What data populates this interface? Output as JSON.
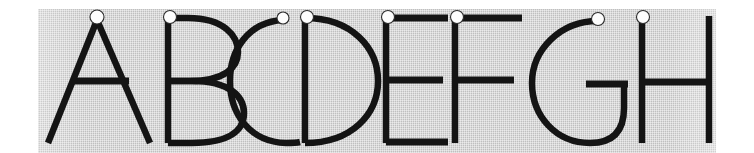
{
  "artwork": {
    "title": "Alphabet specimen A through H",
    "description": "Eight uppercase letterforms drawn in a light geometric sans-serif, printed in black on a gray halftone panel. A small white circle marks the starting point of the first stroke of each letter.",
    "letters": [
      "A",
      "B",
      "C",
      "D",
      "E",
      "F",
      "G",
      "H"
    ],
    "letter_count": 8,
    "stroke_color": "#141414",
    "panel_color": "#c9c9c9",
    "page_color": "#ffffff",
    "marker_fill": "#fdfdfd",
    "marker_stroke": "#2a2a2a",
    "marker_label": "stroke-start-marker",
    "panel": {
      "x": 38,
      "y": 9,
      "width": 678,
      "height": 144
    },
    "cap_top_y": 16,
    "baseline_y": 143,
    "stroke_weight": 7,
    "glyphs": [
      {
        "letter": "A",
        "marker_x": 97,
        "marker_y": 17,
        "advance_left": 46,
        "advance_right": 150
      },
      {
        "letter": "B",
        "marker_x": 170,
        "marker_y": 17,
        "advance_left": 163,
        "advance_right": 238
      },
      {
        "letter": "C",
        "marker_x": 283,
        "marker_y": 18,
        "advance_left": 230,
        "advance_right": 300
      },
      {
        "letter": "D",
        "marker_x": 307,
        "marker_y": 17,
        "advance_left": 302,
        "advance_right": 378
      },
      {
        "letter": "E",
        "marker_x": 388,
        "marker_y": 17,
        "advance_left": 383,
        "advance_right": 448
      },
      {
        "letter": "F",
        "marker_x": 457,
        "marker_y": 17,
        "advance_left": 452,
        "advance_right": 520
      },
      {
        "letter": "G",
        "marker_x": 598,
        "marker_y": 19,
        "advance_left": 530,
        "advance_right": 625
      },
      {
        "letter": "H",
        "marker_x": 643,
        "marker_y": 17,
        "advance_left": 638,
        "advance_right": 712
      }
    ]
  }
}
